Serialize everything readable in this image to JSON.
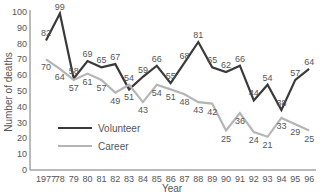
{
  "chart_data": {
    "type": "line",
    "title": "",
    "xlabel": "Year",
    "ylabel": "Number of deaths",
    "ylim": [
      0,
      100
    ],
    "yticks": [
      0,
      10,
      20,
      30,
      40,
      50,
      60,
      70,
      80,
      90,
      100
    ],
    "categories": [
      "1977",
      "78",
      "79",
      "80",
      "81",
      "82",
      "83",
      "84",
      "85",
      "86",
      "87",
      "88",
      "89",
      "90",
      "91",
      "92",
      "93",
      "94",
      "95",
      "96"
    ],
    "series": [
      {
        "name": "Volunteer",
        "color": "#3a3a3a",
        "values": [
          82,
          99,
          58,
          69,
          65,
          67,
          51,
          59,
          66,
          55,
          68,
          81,
          65,
          62,
          66,
          44,
          54,
          38,
          57,
          64
        ]
      },
      {
        "name": "Career",
        "color": "#b5b5b5",
        "values": [
          70,
          64,
          57,
          61,
          57,
          49,
          54,
          43,
          54,
          51,
          48,
          43,
          42,
          25,
          36,
          24,
          21,
          33,
          29,
          25
        ]
      }
    ],
    "legend": {
      "position": "lower-left",
      "entries": [
        "Volunteer",
        "Career"
      ]
    },
    "grid": false
  }
}
